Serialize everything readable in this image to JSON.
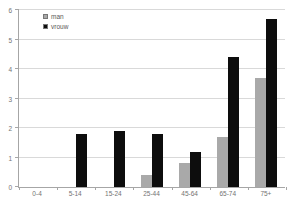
{
  "chart_data": {
    "type": "bar",
    "title": "",
    "xlabel": "",
    "ylabel": "",
    "categories": [
      "0-4",
      "5-14",
      "15-24",
      "25-44",
      "45-64",
      "65-74",
      "75+"
    ],
    "series": [
      {
        "name": "man",
        "color": "#a9a9a9",
        "values": [
          0,
          0,
          0,
          0.4,
          0.8,
          1.7,
          3.7
        ]
      },
      {
        "name": "vrouw",
        "color": "#0d0d0d",
        "values": [
          0,
          1.8,
          1.9,
          1.8,
          1.2,
          4.4,
          5.7
        ]
      }
    ],
    "ylim": [
      0,
      6
    ],
    "ytick_step": 1,
    "ytick_labels": [
      "0",
      "1",
      "2",
      "3",
      "4",
      "5",
      "6"
    ],
    "grid": true,
    "legend_position": "top-left-inside"
  },
  "colors": {
    "gridline": "#d9d9d9",
    "axis": "#a6a6a6",
    "text": "#737373",
    "background": "#ffffff"
  }
}
